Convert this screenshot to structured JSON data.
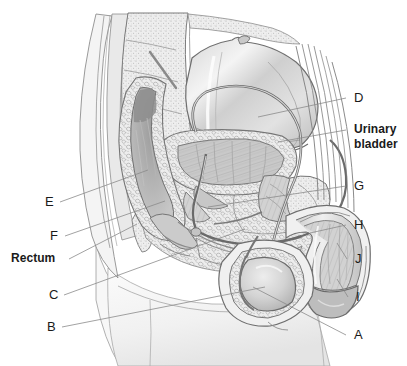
{
  "figure": {
    "type": "anatomical-illustration",
    "background_color": "#ffffff",
    "line_color": "#5a5a5a",
    "leader_line_color": "#8a8a8a",
    "text_color": "#1a1a1a",
    "fill_tones": {
      "skin_light": "#f2f2f2",
      "bone_stipple": "#e6e6e6",
      "muscle_mid": "#cfcfcf",
      "organ_gray": "#c4c4c4",
      "organ_dark": "#a8a8a8",
      "cavity_dark": "#9a9a9a",
      "highlight": "#fafafa"
    }
  },
  "labels": [
    {
      "id": "D",
      "text": "D",
      "kind": "letter",
      "x": 354,
      "y": 90,
      "leader_to_x": 258,
      "leader_to_y": 117
    },
    {
      "id": "UB",
      "text": "Urinary\nbladder",
      "kind": "bold",
      "x": 354,
      "y": 122,
      "leader_to_x": 278,
      "leader_to_y": 142
    },
    {
      "id": "G",
      "text": "G",
      "kind": "letter",
      "x": 354,
      "y": 178,
      "leader_to_x": 208,
      "leader_to_y": 207
    },
    {
      "id": "H",
      "text": "H",
      "kind": "letter",
      "x": 354,
      "y": 217,
      "leader_to_x": 310,
      "leader_to_y": 233
    },
    {
      "id": "J",
      "text": "J",
      "kind": "letter",
      "x": 355,
      "y": 251,
      "leader_to_x": 337,
      "leader_to_y": 243
    },
    {
      "id": "I",
      "text": "I",
      "kind": "letter",
      "x": 356,
      "y": 289,
      "leader_to_x": 337,
      "leader_to_y": 279
    },
    {
      "id": "A",
      "text": "A",
      "kind": "letter",
      "x": 354,
      "y": 327,
      "leader_to_x": 253,
      "leader_to_y": 287
    },
    {
      "id": "E",
      "text": "E",
      "kind": "letter",
      "x": 45,
      "y": 194,
      "leader_to_x": 148,
      "leader_to_y": 170
    },
    {
      "id": "F",
      "text": "F",
      "kind": "letter",
      "x": 50,
      "y": 228,
      "leader_to_x": 165,
      "leader_to_y": 201
    },
    {
      "id": "RE",
      "text": "Rectum",
      "kind": "bold",
      "x": 11,
      "y": 251,
      "leader_to_x": 137,
      "leader_to_y": 224
    },
    {
      "id": "C",
      "text": "C",
      "kind": "letter",
      "x": 49,
      "y": 287,
      "leader_to_x": 245,
      "leader_to_y": 229
    },
    {
      "id": "B",
      "text": "B",
      "kind": "letter",
      "x": 47,
      "y": 319,
      "leader_to_x": 265,
      "leader_to_y": 287
    }
  ],
  "structures": [
    {
      "name": "sacrum-vertebrae",
      "note": "stippled bone, upper left"
    },
    {
      "name": "urinary-bladder",
      "note": "large gray dome, upper center-right"
    },
    {
      "name": "prostate-gland",
      "note": "below bladder, center"
    },
    {
      "name": "rectum",
      "note": "dark cavity, left of prostate"
    },
    {
      "name": "penis-shaft",
      "note": "folded down, right side"
    },
    {
      "name": "glans-penis",
      "note": "bulbous distal end, lower right"
    },
    {
      "name": "testis",
      "note": "oval organ in scrotum, lower center-right"
    },
    {
      "name": "scrotum",
      "note": "sac around testis"
    },
    {
      "name": "pubic-symphysis",
      "note": "bone, center-left of penis base"
    },
    {
      "name": "urethra",
      "note": "tube from bladder through penis"
    },
    {
      "name": "ductus-deferens",
      "note": "tube arcing over bladder"
    },
    {
      "name": "anal-canal",
      "note": "lower left of rectum"
    },
    {
      "name": "thigh-body-outline",
      "note": "pale lower body contour"
    }
  ]
}
